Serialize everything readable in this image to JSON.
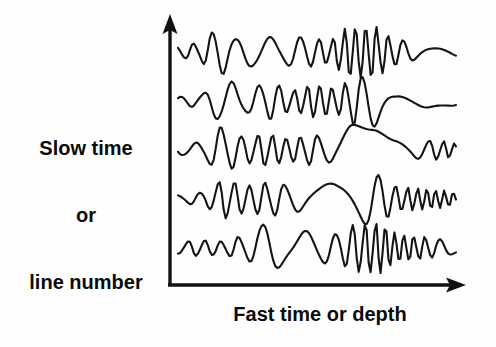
{
  "figure": {
    "background_color": "#fefefe",
    "ink_color": "#111111",
    "title_visible": false
  },
  "y_axis": {
    "label_lines": [
      "Slow time",
      "or",
      "line number"
    ],
    "label_full": "Slow time or line number",
    "arrow": "up-arrow-icon",
    "x_px": 170,
    "top_px": 18,
    "bottom_px": 285
  },
  "x_axis": {
    "label": "Fast time or depth",
    "arrow": "right-arrow-icon",
    "y_px": 285,
    "left_px": 170,
    "right_px": 466
  },
  "chart_data": {
    "type": "line",
    "title": "",
    "xlabel": "Fast time or depth",
    "ylabel": "Slow time or line number",
    "grid": false,
    "legend": "none",
    "axes_style": "arrows, no ticks, no tick labels",
    "xlim": [
      0,
      1
    ],
    "ylim": [
      0,
      1
    ],
    "x_start_px": 178,
    "x_end_px": 456,
    "n_samples": 141,
    "series": [
      {
        "name": "trace-1",
        "baseline_px": 52,
        "amplitude_px": 26,
        "carrier_cycles": 13.5,
        "carrier_phase": 0.35,
        "envelope_nodes": [
          [
            0.0,
            0.2
          ],
          [
            0.07,
            0.34
          ],
          [
            0.15,
            0.9
          ],
          [
            0.22,
            0.46
          ],
          [
            0.3,
            0.62
          ],
          [
            0.38,
            0.5
          ],
          [
            0.46,
            0.58
          ],
          [
            0.54,
            0.44
          ],
          [
            0.62,
            0.96
          ],
          [
            0.7,
            1.0
          ],
          [
            0.78,
            0.52
          ],
          [
            0.86,
            0.3
          ],
          [
            0.93,
            0.22
          ],
          [
            1.0,
            0.16
          ]
        ]
      },
      {
        "name": "trace-2",
        "baseline_px": 101,
        "amplitude_px": 26,
        "carrier_cycles": 13.0,
        "carrier_phase": 0.1,
        "envelope_nodes": [
          [
            0.0,
            0.16
          ],
          [
            0.08,
            0.26
          ],
          [
            0.17,
            0.84
          ],
          [
            0.25,
            0.44
          ],
          [
            0.33,
            0.72
          ],
          [
            0.41,
            0.4
          ],
          [
            0.49,
            0.62
          ],
          [
            0.57,
            0.5
          ],
          [
            0.64,
            0.92
          ],
          [
            0.71,
            0.98
          ],
          [
            0.79,
            0.44
          ],
          [
            0.87,
            0.26
          ],
          [
            0.94,
            0.2
          ],
          [
            1.0,
            0.18
          ]
        ]
      },
      {
        "name": "trace-3",
        "baseline_px": 150,
        "amplitude_px": 26,
        "carrier_cycles": 13.0,
        "carrier_phase": 0.55,
        "envelope_nodes": [
          [
            0.0,
            0.18
          ],
          [
            0.08,
            0.3
          ],
          [
            0.16,
            0.88
          ],
          [
            0.24,
            0.5
          ],
          [
            0.32,
            0.6
          ],
          [
            0.4,
            0.44
          ],
          [
            0.48,
            0.56
          ],
          [
            0.56,
            0.48
          ],
          [
            0.63,
            0.94
          ],
          [
            0.7,
            0.9
          ],
          [
            0.78,
            0.46
          ],
          [
            0.86,
            0.34
          ],
          [
            0.93,
            0.36
          ],
          [
            1.0,
            0.26
          ]
        ]
      },
      {
        "name": "trace-4",
        "baseline_px": 199,
        "amplitude_px": 26,
        "carrier_cycles": 13.5,
        "carrier_phase": 0.25,
        "envelope_nodes": [
          [
            0.0,
            0.14
          ],
          [
            0.08,
            0.24
          ],
          [
            0.17,
            0.72
          ],
          [
            0.25,
            0.52
          ],
          [
            0.33,
            0.64
          ],
          [
            0.41,
            0.5
          ],
          [
            0.49,
            0.46
          ],
          [
            0.57,
            0.62
          ],
          [
            0.65,
            0.96
          ],
          [
            0.72,
            0.92
          ],
          [
            0.8,
            0.44
          ],
          [
            0.88,
            0.4
          ],
          [
            0.94,
            0.34
          ],
          [
            1.0,
            0.24
          ]
        ]
      },
      {
        "name": "trace-5",
        "baseline_px": 248,
        "amplitude_px": 26,
        "carrier_cycles": 14.0,
        "carrier_phase": 0.7,
        "envelope_nodes": [
          [
            0.0,
            0.22
          ],
          [
            0.08,
            0.3
          ],
          [
            0.16,
            0.26
          ],
          [
            0.24,
            0.46
          ],
          [
            0.32,
            0.94
          ],
          [
            0.4,
            0.56
          ],
          [
            0.48,
            0.68
          ],
          [
            0.56,
            0.52
          ],
          [
            0.64,
            0.9
          ],
          [
            0.72,
            0.98
          ],
          [
            0.8,
            0.52
          ],
          [
            0.88,
            0.42
          ],
          [
            0.94,
            0.34
          ],
          [
            1.0,
            0.22
          ]
        ]
      }
    ]
  }
}
